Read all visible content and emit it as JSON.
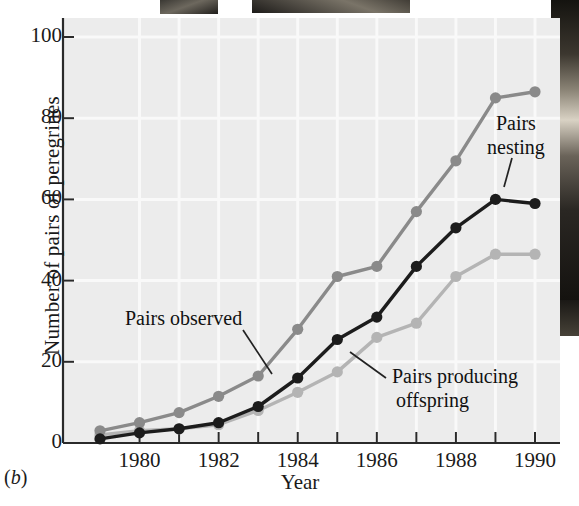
{
  "figure": {
    "panel_label": "(b)",
    "xlabel": "Year",
    "ylabel": "Number of pairs of peregrines"
  },
  "annotations": {
    "observed": "Pairs observed",
    "nesting_line1": "Pairs",
    "nesting_line2": "nesting",
    "offspring_line1": "Pairs producing",
    "offspring_line2": "offspring"
  },
  "colors": {
    "observed": "#8a8a8a",
    "nesting": "#1c1c1c",
    "offspring": "#b4b4b4",
    "plot_background": "#ececec",
    "axis": "#2a2a2a",
    "gridline": "#fafafa"
  },
  "chart_data": {
    "type": "line",
    "title": "",
    "xlabel": "Year",
    "ylabel": "Number of pairs of peregrines",
    "xlim": [
      1979,
      1990
    ],
    "ylim": [
      0,
      104
    ],
    "xticks": [
      1980,
      1982,
      1984,
      1986,
      1988,
      1990
    ],
    "xtick_labels": [
      "1980",
      "1982",
      "1984",
      "1986",
      "1988",
      "1990"
    ],
    "x_minor_ticks": [
      1979,
      1981,
      1983,
      1985,
      1987,
      1989
    ],
    "yticks": [
      0,
      20,
      40,
      60,
      80,
      100
    ],
    "ytick_labels": [
      "0",
      "20",
      "40",
      "60",
      "80",
      "100"
    ],
    "grid": true,
    "legend": "inline-annotations",
    "x": [
      1979,
      1980,
      1981,
      1982,
      1983,
      1984,
      1985,
      1986,
      1987,
      1988,
      1989,
      1990
    ],
    "series": [
      {
        "name": "Pairs observed",
        "color": "#8a8a8a",
        "values": [
          3,
          5,
          7.5,
          11.5,
          16.5,
          28,
          41,
          43.5,
          57,
          69.5,
          85,
          86.5
        ]
      },
      {
        "name": "Pairs nesting",
        "color": "#1c1c1c",
        "values": [
          1,
          2.5,
          3.5,
          5,
          9,
          16,
          25.5,
          31,
          43.5,
          53,
          60,
          59
        ]
      },
      {
        "name": "Pairs producing offspring",
        "color": "#b4b4b4",
        "values": [
          2,
          3,
          3.5,
          4.5,
          8,
          12.5,
          17.5,
          26,
          29.5,
          41,
          46.5,
          46.5
        ]
      }
    ]
  }
}
